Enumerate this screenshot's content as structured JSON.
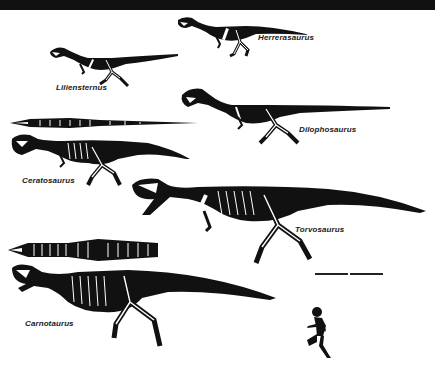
{
  "diagram": {
    "type": "comparative skeletal reconstructions",
    "colors": {
      "ink": "#111111",
      "bone": "#ffffff",
      "background": "#ffffff",
      "top_bar": "#111111"
    },
    "taxa": [
      {
        "name": "Herrerasaurus",
        "views": [
          "lateral"
        ]
      },
      {
        "name": "Liliensternus",
        "views": [
          "lateral"
        ]
      },
      {
        "name": "Dilophosaurus",
        "views": [
          "lateral"
        ]
      },
      {
        "name": "Ceratosaurus",
        "views": [
          "dorsal",
          "lateral"
        ]
      },
      {
        "name": "Torvosaurus",
        "views": [
          "lateral"
        ]
      },
      {
        "name": "Carnotaurus",
        "views": [
          "dorsal",
          "lateral"
        ]
      }
    ],
    "scale_bar": {
      "segments": 2
    },
    "scale_reference": "running-human-silhouette"
  }
}
